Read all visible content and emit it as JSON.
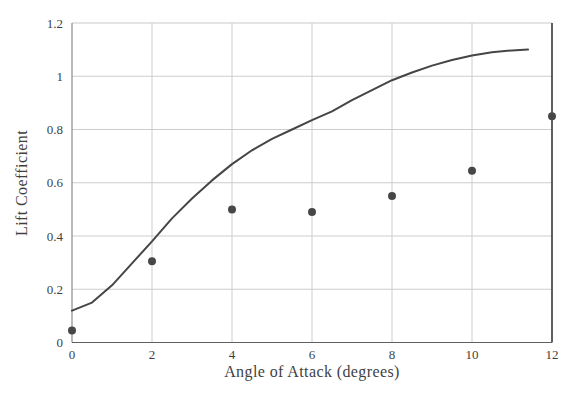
{
  "chart_data": {
    "type": "line",
    "title": "",
    "xlabel": "Angle of Attack (degrees)",
    "ylabel": "Lift Coefficient",
    "xlim": [
      0,
      12
    ],
    "ylim": [
      0,
      1.2
    ],
    "x_ticks": [
      0,
      2,
      4,
      6,
      8,
      10,
      12
    ],
    "x_tick_labels": [
      "0",
      "2",
      "4",
      "6",
      "8",
      "10",
      "12"
    ],
    "y_ticks": [
      0,
      0.2,
      0.4,
      0.6,
      0.8,
      1,
      1.2
    ],
    "y_tick_labels": [
      "0",
      "0.2",
      "0.4",
      "0.6",
      "0.8",
      "1",
      "1.2"
    ],
    "grid": true,
    "legend": "none",
    "series": [
      {
        "name": "theoretical-lift-curve",
        "type": "line",
        "color": "#454545",
        "stroke_width": 2,
        "points": [
          [
            0,
            0.12
          ],
          [
            0.5,
            0.15
          ],
          [
            1,
            0.215
          ],
          [
            1.5,
            0.297
          ],
          [
            2,
            0.38
          ],
          [
            2.5,
            0.466
          ],
          [
            3,
            0.541
          ],
          [
            3.5,
            0.609
          ],
          [
            4,
            0.67
          ],
          [
            4.5,
            0.722
          ],
          [
            5,
            0.765
          ],
          [
            5.5,
            0.8
          ],
          [
            6,
            0.835
          ],
          [
            6.5,
            0.868
          ],
          [
            7,
            0.91
          ],
          [
            7.5,
            0.948
          ],
          [
            8,
            0.985
          ],
          [
            8.5,
            1.014
          ],
          [
            9,
            1.04
          ],
          [
            9.5,
            1.061
          ],
          [
            10,
            1.078
          ],
          [
            10.5,
            1.09
          ],
          [
            11,
            1.097
          ],
          [
            11.4,
            1.1
          ]
        ]
      },
      {
        "name": "measured-lift-data",
        "type": "scatter",
        "color": "#474747",
        "marker": "circle",
        "marker_radius": 4,
        "points": [
          [
            0,
            0.045
          ],
          [
            2,
            0.305
          ],
          [
            4,
            0.5
          ],
          [
            6,
            0.49
          ],
          [
            8,
            0.55
          ],
          [
            10,
            0.645
          ],
          [
            12,
            0.85
          ]
        ]
      }
    ],
    "colors": {
      "background": "#ffffff",
      "gridline": "#cdcdcd",
      "plot_border_top": "#c9c9c9",
      "plot_border_right": "#4f4f4f",
      "plot_border_left": "#8a8a8a",
      "plot_border_bottom": "#5f5f5f",
      "tick_text": "#3f3f3f",
      "axis_title_text": "#3f3f3f"
    }
  }
}
